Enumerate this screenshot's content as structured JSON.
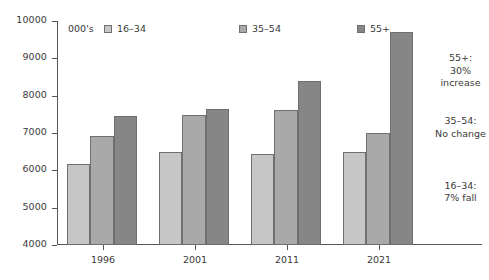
{
  "chart_data": {
    "type": "bar",
    "title": "",
    "subtitle": "",
    "xlabel": "",
    "ylabel": "",
    "unit_label": "000's",
    "categories": [
      "1996",
      "2001",
      "2011",
      "2021"
    ],
    "series": [
      {
        "name": "16–34",
        "color": "#c6c6c6",
        "values": [
          6180,
          6500,
          6430,
          6480
        ]
      },
      {
        "name": "35–54",
        "color": "#a9a9a9",
        "values": [
          6930,
          7470,
          7620,
          7010
        ]
      },
      {
        "name": "55+",
        "color": "#868686",
        "values": [
          7460,
          7630,
          8390,
          9700
        ]
      }
    ],
    "ylim": [
      4000,
      10000
    ],
    "yticks": [
      4000,
      5000,
      6000,
      7000,
      8000,
      9000,
      10000
    ],
    "ytick_labels": [
      "4000",
      "5000",
      "6000",
      "7000",
      "8000",
      "9000",
      "10000"
    ],
    "grid": false,
    "legend_position": "top-inside"
  },
  "annotations": [
    {
      "title": "55+:",
      "line2": "30%",
      "line3": "increase",
      "y_frac": 0.22
    },
    {
      "title": "35–54:",
      "line2": "No change",
      "line3": "",
      "y_frac": 0.5
    },
    {
      "title": "16–34:",
      "line2": "7% fall",
      "line3": "",
      "y_frac": 0.79
    }
  ]
}
